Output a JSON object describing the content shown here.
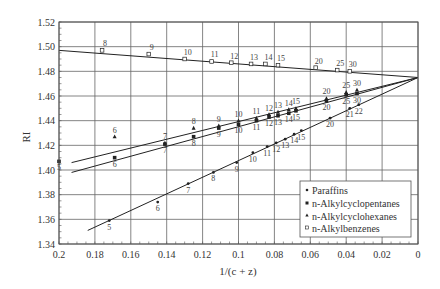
{
  "chart_data": {
    "type": "scatter",
    "title": "",
    "xlabel": "1/(c + z)",
    "ylabel": "RI",
    "xlim": [
      0.2,
      0
    ],
    "ylim": [
      1.34,
      1.52
    ],
    "x_reversed": true,
    "grid": true,
    "x_ticks": [
      "0.2",
      "0.18",
      "0.16",
      "0.14",
      "0.12",
      "0.1",
      "0.08",
      "0.06",
      "0.04",
      "0.02",
      "0"
    ],
    "y_ticks": [
      "1.34",
      "1.36",
      "1.38",
      "1.40",
      "1.42",
      "1.44",
      "1.46",
      "1.48",
      "1.50",
      "1.52"
    ],
    "legend_position": "lower right",
    "convergence_point": {
      "x": 0,
      "y": 1.475
    },
    "series": [
      {
        "name": "Paraffins",
        "marker": "dot",
        "fit_line": {
          "x0": 0.184,
          "y0": 1.351,
          "x1": 0,
          "y1": 1.475
        },
        "points": [
          {
            "label": "5",
            "x": 0.172,
            "y": 1.359
          },
          {
            "label": "6",
            "x": 0.145,
            "y": 1.374
          },
          {
            "label": "7",
            "x": 0.128,
            "y": 1.389
          },
          {
            "label": "8",
            "x": 0.114,
            "y": 1.398
          },
          {
            "label": "9",
            "x": 0.101,
            "y": 1.406
          },
          {
            "label": "10",
            "x": 0.092,
            "y": 1.414
          },
          {
            "label": "11",
            "x": 0.084,
            "y": 1.419
          },
          {
            "label": "12",
            "x": 0.079,
            "y": 1.422
          },
          {
            "label": "13",
            "x": 0.074,
            "y": 1.425
          },
          {
            "label": "14",
            "x": 0.069,
            "y": 1.429
          },
          {
            "label": "15",
            "x": 0.065,
            "y": 1.432
          },
          {
            "label": "20",
            "x": 0.049,
            "y": 1.442
          },
          {
            "label": "21",
            "x": 0.038,
            "y": 1.45
          },
          {
            "label": "22",
            "x": 0.033,
            "y": 1.453
          }
        ]
      },
      {
        "name": "n-Alkylcyclopentanes",
        "marker": "square-filled",
        "fit_line": {
          "x0": 0.193,
          "y0": 1.398,
          "x1": 0,
          "y1": 1.475
        },
        "points": [
          {
            "label": "5",
            "x": 0.2,
            "y": 1.407
          },
          {
            "label": "6",
            "x": 0.169,
            "y": 1.41
          },
          {
            "label": "7",
            "x": 0.141,
            "y": 1.421
          },
          {
            "label": "8",
            "x": 0.125,
            "y": 1.427
          },
          {
            "label": "9",
            "x": 0.111,
            "y": 1.434
          },
          {
            "label": "10",
            "x": 0.1,
            "y": 1.437
          },
          {
            "label": "11",
            "x": 0.09,
            "y": 1.44
          },
          {
            "label": "12",
            "x": 0.083,
            "y": 1.443
          },
          {
            "label": "13",
            "x": 0.078,
            "y": 1.444
          },
          {
            "label": "14",
            "x": 0.072,
            "y": 1.446
          },
          {
            "label": "15",
            "x": 0.068,
            "y": 1.448
          },
          {
            "label": "20",
            "x": 0.051,
            "y": 1.456
          },
          {
            "label": "25",
            "x": 0.04,
            "y": 1.461
          },
          {
            "label": "30",
            "x": 0.034,
            "y": 1.462
          }
        ]
      },
      {
        "name": "n-Alkylcyclohexanes",
        "marker": "triangle-filled",
        "fit_line": {
          "x0": 0.193,
          "y0": 1.406,
          "x1": 0,
          "y1": 1.475
        },
        "points": [
          {
            "label": "6",
            "x": 0.169,
            "y": 1.427
          },
          {
            "label": "7",
            "x": 0.141,
            "y": 1.422
          },
          {
            "label": "8",
            "x": 0.125,
            "y": 1.434
          },
          {
            "label": "9",
            "x": 0.111,
            "y": 1.436
          },
          {
            "label": "10",
            "x": 0.1,
            "y": 1.44
          },
          {
            "label": "11",
            "x": 0.09,
            "y": 1.442
          },
          {
            "label": "12",
            "x": 0.083,
            "y": 1.445
          },
          {
            "label": "13",
            "x": 0.078,
            "y": 1.447
          },
          {
            "label": "14",
            "x": 0.072,
            "y": 1.449
          },
          {
            "label": "15",
            "x": 0.068,
            "y": 1.45
          },
          {
            "label": "20",
            "x": 0.051,
            "y": 1.458
          },
          {
            "label": "25",
            "x": 0.04,
            "y": 1.463
          },
          {
            "label": "30",
            "x": 0.034,
            "y": 1.465
          }
        ]
      },
      {
        "name": "n-Alkylbenzenes",
        "marker": "square-open",
        "fit_line": {
          "x0": 0.2,
          "y0": 1.497,
          "x1": 0,
          "y1": 1.475
        },
        "points": [
          {
            "label": "8",
            "x": 0.176,
            "y": 1.497
          },
          {
            "label": "9",
            "x": 0.15,
            "y": 1.494
          },
          {
            "label": "10",
            "x": 0.13,
            "y": 1.49
          },
          {
            "label": "11",
            "x": 0.115,
            "y": 1.488
          },
          {
            "label": "12",
            "x": 0.104,
            "y": 1.487
          },
          {
            "label": "13",
            "x": 0.093,
            "y": 1.486
          },
          {
            "label": "14",
            "x": 0.085,
            "y": 1.486
          },
          {
            "label": "15",
            "x": 0.078,
            "y": 1.485
          },
          {
            "label": "20",
            "x": 0.057,
            "y": 1.483
          },
          {
            "label": "25",
            "x": 0.045,
            "y": 1.481
          },
          {
            "label": "30",
            "x": 0.038,
            "y": 1.48
          }
        ]
      }
    ]
  },
  "legend": {
    "items": [
      {
        "label": "Paraffins",
        "marker": "dot"
      },
      {
        "label": "n-Alkylcyclopentanes",
        "marker": "square-filled"
      },
      {
        "label": "n-Alkylcyclohexanes",
        "marker": "triangle-filled"
      },
      {
        "label": "n-Alkylbenzenes",
        "marker": "square-open"
      }
    ]
  },
  "axes": {
    "x_label": "1/(c + z)",
    "y_label": "RI"
  }
}
